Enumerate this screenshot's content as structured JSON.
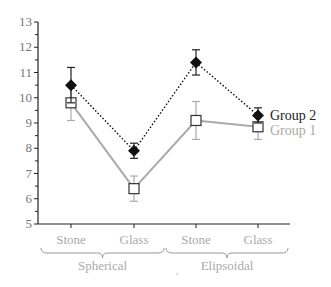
{
  "chart_data": {
    "type": "line",
    "title": "",
    "xlabel": "",
    "ylabel": "",
    "ylim": [
      5,
      13
    ],
    "yticks": [
      5,
      6,
      7,
      8,
      9,
      10,
      11,
      12,
      13
    ],
    "grid": false,
    "categories": [
      "Stone",
      "Glass",
      "Stone",
      "Glass"
    ],
    "category_groups": [
      {
        "label": "Spherical",
        "span": [
          0,
          1
        ]
      },
      {
        "label": "Elipsoidal",
        "span": [
          2,
          3
        ]
      }
    ],
    "legend_position": "inline-right",
    "series": [
      {
        "name": "Group 2",
        "marker": "filled-diamond",
        "line": "dotted",
        "color": "#111111",
        "values": [
          10.5,
          7.9,
          11.4,
          9.3
        ],
        "errors": [
          0.7,
          0.3,
          0.5,
          0.3
        ]
      },
      {
        "name": "Group 1",
        "marker": "open-square",
        "line": "solid",
        "color": "#aaaaaa",
        "values": [
          9.8,
          6.4,
          9.1,
          8.85
        ],
        "errors": [
          0.7,
          0.5,
          0.75,
          0.5
        ]
      }
    ]
  }
}
